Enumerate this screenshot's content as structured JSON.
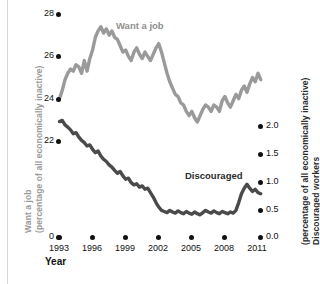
{
  "chart_data": {
    "type": "line",
    "title": "",
    "xlabel": "Year",
    "grid": false,
    "legend_position": "inline-annotations",
    "xlim": [
      1993,
      2011.5
    ],
    "xticks": [
      1993,
      1996,
      1999,
      2002,
      2005,
      2008,
      2011
    ],
    "xticklabels": [
      "1993",
      "1996",
      "1999",
      "2002",
      "2005",
      "2008",
      "2011"
    ],
    "axes": {
      "left": {
        "title_line1": "Want a job",
        "title_line2": "(percentage of all economically inactive)",
        "ylim": [
          0,
          28
        ],
        "yticks": [
          0,
          22,
          24,
          26,
          28
        ],
        "yticklabels": [
          "0",
          "22",
          "24",
          "26",
          "28"
        ],
        "color": "#9a9a9a"
      },
      "right": {
        "title_line1": "Discouraged workers",
        "title_line2": "(percentage of all economically inactive)",
        "ylim": [
          0.0,
          2.5
        ],
        "yticks": [
          0.0,
          0.5,
          1.0,
          1.5,
          2.0
        ],
        "yticklabels": [
          "0.0",
          "0.5",
          "1.0",
          "1.5",
          "2.0"
        ],
        "color": "#4a4a4a"
      }
    },
    "series": [
      {
        "name": "Want a job",
        "label": "Want a job",
        "axis": "left",
        "color": "#9a9a9a",
        "x": [
          1993.0,
          1993.25,
          1993.5,
          1993.75,
          1994.0,
          1994.25,
          1994.5,
          1994.75,
          1995.0,
          1995.25,
          1995.5,
          1995.75,
          1996.0,
          1996.25,
          1996.5,
          1996.75,
          1997.0,
          1997.25,
          1997.5,
          1997.75,
          1998.0,
          1998.25,
          1998.5,
          1998.75,
          1999.0,
          1999.25,
          1999.5,
          1999.75,
          2000.0,
          2000.25,
          2000.5,
          2000.75,
          2001.0,
          2001.25,
          2001.5,
          2001.75,
          2002.0,
          2002.25,
          2002.5,
          2002.75,
          2003.0,
          2003.25,
          2003.5,
          2003.75,
          2004.0,
          2004.25,
          2004.5,
          2004.75,
          2005.0,
          2005.25,
          2005.5,
          2005.75,
          2006.0,
          2006.25,
          2006.5,
          2006.75,
          2007.0,
          2007.25,
          2007.5,
          2007.75,
          2008.0,
          2008.25,
          2008.5,
          2008.75,
          2009.0,
          2009.25,
          2009.5,
          2009.75,
          2010.0,
          2010.25,
          2010.5,
          2010.75,
          2011.0,
          2011.25
        ],
        "values": [
          24.0,
          24.4,
          24.9,
          25.2,
          25.4,
          25.3,
          25.6,
          25.5,
          25.2,
          25.8,
          25.3,
          25.9,
          26.3,
          26.9,
          27.2,
          27.4,
          27.1,
          27.3,
          27.0,
          27.2,
          26.9,
          26.8,
          26.5,
          26.2,
          26.3,
          26.0,
          25.8,
          26.2,
          26.4,
          26.1,
          25.9,
          26.2,
          26.0,
          25.8,
          26.1,
          26.4,
          26.6,
          26.2,
          25.7,
          25.2,
          24.8,
          24.5,
          24.2,
          24.1,
          23.8,
          23.7,
          23.4,
          23.2,
          23.4,
          23.1,
          22.9,
          23.2,
          23.5,
          23.7,
          23.6,
          23.4,
          23.7,
          23.6,
          23.4,
          23.9,
          24.1,
          23.8,
          23.6,
          23.9,
          24.2,
          24.0,
          24.4,
          24.6,
          24.3,
          24.7,
          25.0,
          24.8,
          25.2,
          24.9
        ]
      },
      {
        "name": "Discouraged",
        "label": "Discouraged",
        "axis": "right",
        "color": "#4a4a4a",
        "x": [
          1993.0,
          1993.25,
          1993.5,
          1993.75,
          1994.0,
          1994.25,
          1994.5,
          1994.75,
          1995.0,
          1995.25,
          1995.5,
          1995.75,
          1996.0,
          1996.25,
          1996.5,
          1996.75,
          1997.0,
          1997.25,
          1997.5,
          1997.75,
          1998.0,
          1998.25,
          1998.5,
          1998.75,
          1999.0,
          1999.25,
          1999.5,
          1999.75,
          2000.0,
          2000.25,
          2000.5,
          2000.75,
          2001.0,
          2001.25,
          2001.5,
          2001.75,
          2002.0,
          2002.25,
          2002.5,
          2002.75,
          2003.0,
          2003.25,
          2003.5,
          2003.75,
          2004.0,
          2004.25,
          2004.5,
          2004.75,
          2005.0,
          2005.25,
          2005.5,
          2005.75,
          2006.0,
          2006.25,
          2006.5,
          2006.75,
          2007.0,
          2007.25,
          2007.5,
          2007.75,
          2008.0,
          2008.25,
          2008.5,
          2008.75,
          2009.0,
          2009.25,
          2009.5,
          2009.75,
          2010.0,
          2010.25,
          2010.5,
          2010.75,
          2011.0,
          2011.25
        ],
        "values": [
          2.08,
          2.1,
          2.02,
          1.98,
          1.93,
          1.86,
          1.88,
          1.8,
          1.74,
          1.7,
          1.64,
          1.66,
          1.58,
          1.52,
          1.55,
          1.46,
          1.4,
          1.36,
          1.3,
          1.26,
          1.2,
          1.15,
          1.18,
          1.1,
          1.04,
          1.06,
          0.98,
          0.94,
          0.96,
          0.9,
          0.92,
          0.86,
          0.88,
          0.8,
          0.72,
          0.62,
          0.54,
          0.48,
          0.46,
          0.44,
          0.48,
          0.45,
          0.43,
          0.47,
          0.44,
          0.42,
          0.46,
          0.43,
          0.41,
          0.45,
          0.42,
          0.4,
          0.44,
          0.48,
          0.45,
          0.43,
          0.47,
          0.44,
          0.42,
          0.46,
          0.44,
          0.42,
          0.45,
          0.43,
          0.48,
          0.62,
          0.78,
          0.88,
          0.95,
          0.88,
          0.82,
          0.86,
          0.8,
          0.78
        ]
      }
    ]
  },
  "xaxis_title": "Year",
  "left_axis": {
    "title_line1": "Want a job",
    "title_line2": "(percentage of all economically inactive)",
    "tick0": "0",
    "tick22": "22",
    "tick24": "24",
    "tick26": "26",
    "tick28": "28"
  },
  "right_axis": {
    "title_line1": "Discouraged workers",
    "title_line2": "(percentage of all economically inactive)",
    "tick00": "0.0",
    "tick05": "0.5",
    "tick10": "1.0",
    "tick15": "1.5",
    "tick20": "2.0"
  },
  "xticks": {
    "t0": "1993",
    "t1": "1996",
    "t2": "1999",
    "t3": "2002",
    "t4": "2005",
    "t5": "2008",
    "t6": "2011"
  },
  "annotations": {
    "want_a_job": "Want a job",
    "discouraged": "Discouraged"
  },
  "colors": {
    "want_a_job": "#9a9a9a",
    "discouraged": "#4a4a4a",
    "tick": "#111111",
    "background": "#ffffff"
  }
}
